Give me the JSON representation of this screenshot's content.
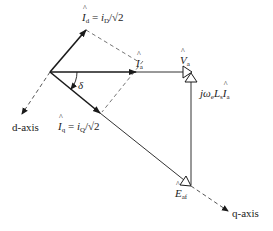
{
  "diagram": {
    "type": "phasor-diagram",
    "colors": {
      "line": "#1a1a1a",
      "dashed": "#555555",
      "background": "#ffffff"
    },
    "labels": {
      "id_main": "I",
      "id_sub": "d",
      "id_rhs_i": "i",
      "id_rhs_sub": "D",
      "id_rhs_tail": "/√2",
      "ia_main": "I",
      "ia_sub": "a",
      "iq_main": "I",
      "iq_sub": "q",
      "iq_rhs_i": "i",
      "iq_rhs_sub": "Q",
      "iq_rhs_tail": "/√2",
      "equals": " = ",
      "va_main": "V",
      "va_sub": "a",
      "drop_prefix": "jω",
      "drop_sub_e": "e",
      "drop_L": "L",
      "drop_sub_s": "s",
      "drop_I": "I",
      "drop_sub_a": "a",
      "eaf_main": "E",
      "eaf_sub": "af",
      "delta": "δ",
      "d_axis": "d-axis",
      "q_axis": "q-axis"
    },
    "points": {
      "origin": [
        50,
        72
      ],
      "id_tip": [
        86,
        30
      ],
      "ia_tip": [
        136,
        72
      ],
      "iq_tip": [
        100,
        113
      ],
      "va_tip": [
        191,
        72
      ],
      "eaf_tip": [
        191,
        185
      ],
      "d_axis_end": [
        20,
        117
      ],
      "q_axis_end": [
        230,
        212
      ]
    }
  }
}
